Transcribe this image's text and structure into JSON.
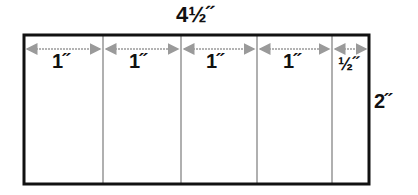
{
  "diagram": {
    "total_width_label": "4½˝",
    "height_label": "2˝",
    "segments": [
      {
        "label": "1˝",
        "width_in": 1
      },
      {
        "label": "1˝",
        "width_in": 1
      },
      {
        "label": "1˝",
        "width_in": 1
      },
      {
        "label": "1˝",
        "width_in": 1
      },
      {
        "label": "½˝",
        "width_in": 0.5
      }
    ],
    "colors": {
      "outline": "#111111",
      "divider": "#b0b0b0",
      "arrow": "#9a9a9a"
    }
  }
}
